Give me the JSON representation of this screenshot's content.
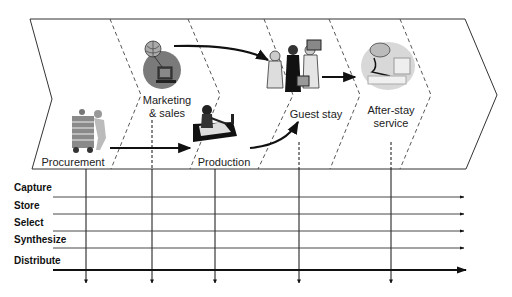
{
  "diagram": {
    "type": "value-chain-with-information-flows",
    "stages": [
      {
        "id": "procurement",
        "label": "Procurement",
        "icon": "worker-with-handcart-icon"
      },
      {
        "id": "marketing",
        "label_line1": "Marketing",
        "label_line2": "& sales",
        "icon": "globe-computer-icon"
      },
      {
        "id": "production",
        "label": "Production",
        "icon": "chef-at-stove-icon"
      },
      {
        "id": "guest-stay",
        "label": "Guest stay",
        "icon": "travelers-with-luggage-icon"
      },
      {
        "id": "after-stay",
        "label_line1": "After-stay",
        "label_line2": "service",
        "icon": "customer-service-agent-icon"
      }
    ],
    "information_activities": [
      {
        "label": "Capture"
      },
      {
        "label": "Store"
      },
      {
        "label": "Select"
      },
      {
        "label": "Synthesize"
      },
      {
        "label": "Distribute"
      }
    ],
    "flows": [
      {
        "from": "procurement",
        "to": "production"
      },
      {
        "from": "marketing",
        "to": "guest-stay"
      },
      {
        "from": "production",
        "to": "guest-stay"
      },
      {
        "from": "guest-stay",
        "to": "after-stay"
      }
    ],
    "colors": {
      "line": "#111111",
      "dashed": "#444444",
      "icon_gray": "#7a7a7a",
      "icon_light": "#cfcfcf"
    }
  }
}
